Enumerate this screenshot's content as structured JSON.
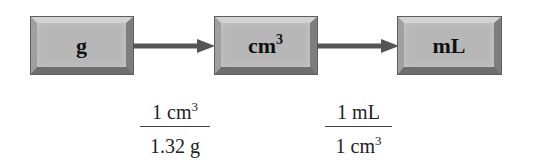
{
  "diagram": {
    "type": "unit-conversion-flow",
    "colors": {
      "box_face": "#b7b7b7",
      "box_border": "#5e5e5e",
      "arrow": "#555555",
      "text": "#111111"
    },
    "boxes": [
      {
        "label": "g",
        "superscript": ""
      },
      {
        "label": "cm",
        "superscript": "3"
      },
      {
        "label": "mL",
        "superscript": ""
      }
    ],
    "conversion_factors": [
      {
        "numerator": {
          "text": "1 cm",
          "superscript": "3"
        },
        "denominator": {
          "text": "1.32 g",
          "superscript": ""
        }
      },
      {
        "numerator": {
          "text": "1 mL",
          "superscript": ""
        },
        "denominator": {
          "text": "1 cm",
          "superscript": "3"
        }
      }
    ]
  }
}
